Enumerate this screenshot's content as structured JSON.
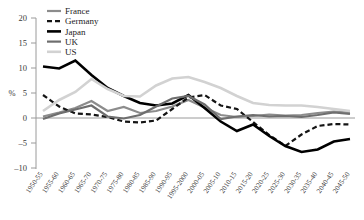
{
  "chart_data": {
    "type": "line",
    "title": "",
    "xlabel": "",
    "ylabel": "%",
    "ylim": [
      -10,
      20
    ],
    "yticks": [
      20,
      15,
      10,
      5,
      0,
      -5,
      -10
    ],
    "grid": false,
    "legend_position": "top-left",
    "categories": [
      "1950-55",
      "1955-60",
      "1960-65",
      "1965-70",
      "1970-75",
      "1975-80",
      "1980-85",
      "1985-90",
      "1990-95",
      "1995-2000",
      "2000-05",
      "2005-10",
      "2010-15",
      "2015-20",
      "2020-25",
      "2025-30",
      "2030-35",
      "2035-40",
      "2040-45",
      "2045-50"
    ],
    "series": [
      {
        "name": "France",
        "color": "#8c8c8c",
        "style": "solid",
        "width": 2.2,
        "values": [
          0.3,
          1.1,
          2.0,
          3.4,
          1.4,
          2.2,
          1.0,
          1.4,
          2.3,
          3.6,
          2.1,
          0.6,
          0.2,
          0.4,
          0.7,
          0.5,
          0.6,
          1.0,
          1.3,
          1.1
        ]
      },
      {
        "name": "Germany",
        "color": "#141414",
        "style": "dashed",
        "width": 2.2,
        "values": [
          4.6,
          2.3,
          0.9,
          0.7,
          0.2,
          -0.7,
          -0.9,
          -0.5,
          1.8,
          4.1,
          4.6,
          2.5,
          1.8,
          -0.8,
          -3.4,
          -5.6,
          -3.3,
          -1.6,
          -1.2,
          -1.3
        ]
      },
      {
        "name": "Japan",
        "color": "#000000",
        "style": "solid",
        "width": 2.6,
        "values": [
          10.3,
          9.9,
          11.5,
          8.6,
          6.0,
          4.4,
          3.0,
          2.5,
          2.9,
          4.6,
          2.0,
          -0.7,
          -2.6,
          -1.3,
          -3.6,
          -5.6,
          -6.8,
          -6.3,
          -4.7,
          -4.2
        ]
      },
      {
        "name": "UK",
        "color": "#6e6e6e",
        "style": "solid",
        "width": 2.2,
        "values": [
          -0.2,
          0.9,
          1.7,
          2.5,
          0.3,
          -0.1,
          0.6,
          2.3,
          3.9,
          4.4,
          2.7,
          -0.2,
          0.3,
          0.6,
          0.3,
          0.4,
          0.2,
          0.6,
          1.1,
          0.8
        ]
      },
      {
        "name": "US",
        "color": "#d2d2d2",
        "style": "solid",
        "width": 2.6,
        "values": [
          1.4,
          3.6,
          5.2,
          7.8,
          5.8,
          4.4,
          4.3,
          6.5,
          7.9,
          8.2,
          7.2,
          6.0,
          4.4,
          3.0,
          2.6,
          2.5,
          2.5,
          2.2,
          1.8,
          1.4
        ]
      }
    ]
  },
  "legend": {
    "items": [
      {
        "label": "France"
      },
      {
        "label": "Germany"
      },
      {
        "label": "Japan"
      },
      {
        "label": "UK"
      },
      {
        "label": "US"
      }
    ]
  }
}
